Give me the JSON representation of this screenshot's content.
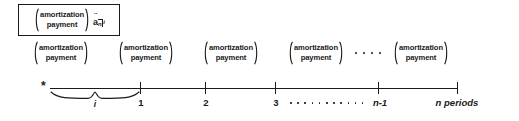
{
  "figure": {
    "kind": "annuity-due-amortization-timeline",
    "background_color": "#ffffff",
    "ink_color": "#1a1a1a"
  },
  "formula_box": {
    "term": {
      "line1": "amortization",
      "line2": "payment"
    },
    "annuity_symbol": {
      "base": "a",
      "accent": "¨",
      "periods": "n",
      "rate": "i",
      "plain_text": "ä n|i"
    }
  },
  "payments": {
    "terms": [
      {
        "line1": "amortization",
        "line2": "payment",
        "x": 33
      },
      {
        "line1": "amortization",
        "line2": "payment",
        "x": 118
      },
      {
        "line1": "amortization",
        "line2": "payment",
        "x": 203
      },
      {
        "line1": "amortization",
        "line2": "payment",
        "x": 288
      },
      {
        "line1": "amortization",
        "line2": "payment",
        "x": 393
      }
    ],
    "ellipsis": {
      "x": 355,
      "dot_count": 4
    }
  },
  "timeline": {
    "axis": {
      "start_x": 50,
      "end_x": 457,
      "y": 22
    },
    "start_marker": "*",
    "ticks": [
      {
        "label": "1",
        "x": 140,
        "italic": false
      },
      {
        "label": "2",
        "x": 205,
        "italic": false
      },
      {
        "label": "3",
        "x": 275,
        "italic": false
      },
      {
        "label": "n-1",
        "x": 378,
        "italic": true
      },
      {
        "label": "n periods",
        "x": 457,
        "italic": true
      }
    ],
    "interval_brace": {
      "label": "i",
      "start_x": 50,
      "end_x": 140
    },
    "axis_ellipsis": {
      "start_x": 288,
      "dot_count": 11
    }
  }
}
